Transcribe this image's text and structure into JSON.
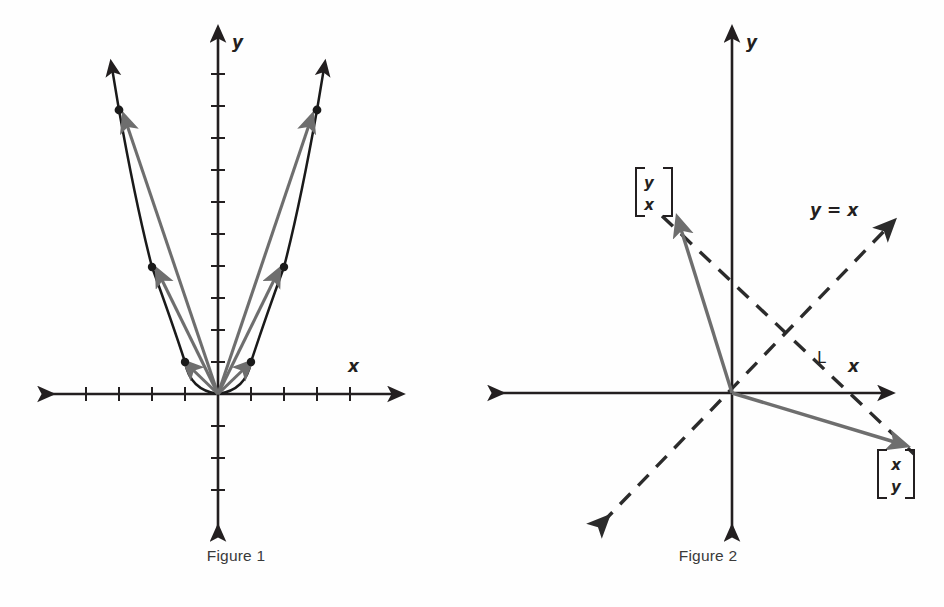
{
  "page": {
    "background": "#fefefe",
    "width": 944,
    "height": 607
  },
  "colors": {
    "ink": "#231f20",
    "curve": "#1a1a1a",
    "vector_gray": "#6e6e6e",
    "dashed": "#2b2b2b",
    "caption": "#3a3a3a"
  },
  "figure1": {
    "caption": "Figure 1",
    "axes": {
      "x_label": "x",
      "y_label": "y",
      "origin": {
        "x": 218,
        "y": 394
      },
      "x_range_px": [
        42,
        400
      ],
      "y_range_px": [
        30,
        537
      ],
      "tick_spacing_px": 32,
      "x_ticks": [
        -5,
        -4,
        -3,
        -2,
        -1,
        1,
        2,
        3,
        4,
        5
      ],
      "y_ticks": [
        -4,
        -3,
        -2,
        -1,
        1,
        2,
        3,
        4,
        5,
        6,
        7,
        8,
        9,
        10
      ]
    },
    "curve": {
      "type": "parabola",
      "equation": "y = x^2",
      "color": "#1a1a1a",
      "arrowheads": [
        "up-left-branch",
        "up-right-branch"
      ]
    },
    "points": [
      {
        "label": "",
        "dx_px": -99,
        "dy_px": -284
      },
      {
        "label": "",
        "dx_px": -66,
        "dy_px": -127
      },
      {
        "label": "",
        "dx_px": -33,
        "dy_px": -32
      },
      {
        "label": "",
        "dx_px": 33,
        "dy_px": -32
      },
      {
        "label": "",
        "dx_px": 66,
        "dy_px": -127
      },
      {
        "label": "",
        "dx_px": 99,
        "dy_px": -284
      }
    ],
    "vectors_from_origin": 6,
    "vector_color": "#6e6e6e"
  },
  "figure2": {
    "caption": "Figure 2",
    "axes": {
      "x_label": "x",
      "y_label": "y",
      "origin": {
        "x": 260,
        "y": 393
      },
      "x_range_px": [
        20,
        420
      ],
      "y_range_px": [
        30,
        537
      ]
    },
    "vectors": [
      {
        "name": "vector-yx",
        "label_top": "y",
        "label_bottom": "x",
        "tip": {
          "x": 204,
          "y": 222
        },
        "color": "#6e6e6e",
        "label_pos": {
          "x": 168,
          "y": 186
        }
      },
      {
        "name": "vector-xy",
        "label_top": "x",
        "label_bottom": "y",
        "tip": {
          "x": 431,
          "y": 447
        },
        "color": "#6e6e6e",
        "label_pos": {
          "x": 408,
          "y": 455
        }
      }
    ],
    "dashed_lines": [
      {
        "name": "line-y-equals-x",
        "label": "y = x",
        "label_pos": {
          "x": 370,
          "y": 212
        },
        "from": {
          "x": 128,
          "y": 525
        },
        "to": {
          "x": 418,
          "y": 225
        },
        "arrow_both_ends": true
      },
      {
        "name": "line-L",
        "label": "L",
        "label_pos": {
          "x": 351,
          "y": 360
        },
        "from": {
          "x": 188,
          "y": 215
        },
        "to": {
          "x": 443,
          "y": 455
        },
        "arrow_both_ends": false
      }
    ]
  }
}
